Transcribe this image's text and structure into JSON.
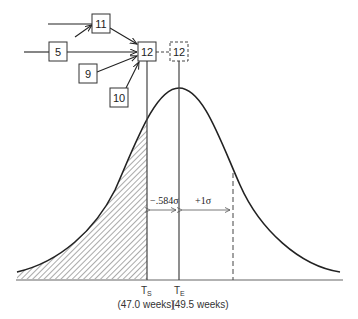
{
  "diagram": {
    "title": "",
    "network_nodes": [
      {
        "id": "11",
        "label": "11"
      },
      {
        "id": "5",
        "label": "5"
      },
      {
        "id": "9",
        "label": "9"
      },
      {
        "id": "10",
        "label": "10"
      },
      {
        "id": "12",
        "label": "12"
      },
      {
        "id": "12-shifted",
        "label": "12",
        "style": "dashed"
      }
    ],
    "distribution": {
      "type": "normal-curve",
      "shaded_region": "left tail up to T_S"
    },
    "markers": {
      "ts": {
        "symbol": "T",
        "subscript": "S",
        "value": "(47.0 weeks)"
      },
      "te": {
        "symbol": "T",
        "subscript": "E",
        "value": "(49.5 weeks)"
      }
    },
    "dimensions": {
      "minus_sigma": "−.584σ",
      "plus_sigma": "+1σ"
    },
    "colors": {
      "line": "#222222",
      "hatch": "#555555",
      "baseline": "#999999"
    }
  }
}
